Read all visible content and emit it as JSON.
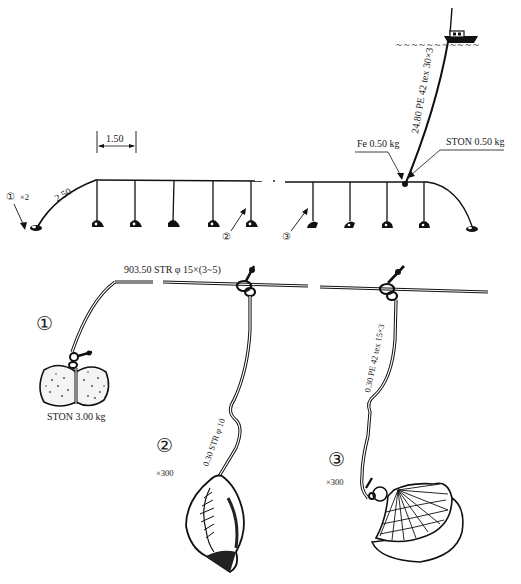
{
  "overview": {
    "buoy_line_label": "24.80 PE 42 tex 30×3",
    "fe_weight_label": "Fe 0.50 kg",
    "ston_small_label": "STON 0.50 kg",
    "spacing_label": "1.50",
    "end_line_label": "2.50",
    "callout_1": "①",
    "callout_1_count": "×2",
    "callout_2": "②",
    "callout_3": "③",
    "left_branch_count": 5,
    "right_branch_count": 4,
    "water_waves": "~ ~ ~ ~ ~ ~ ~ ~ ~ ~ ~"
  },
  "detail": {
    "main_line_label": "903.50 STR φ 15×(3~5)",
    "part1": {
      "number": "①",
      "weight_label": "STON 3.00 kg"
    },
    "part2": {
      "number": "②",
      "count": "×300",
      "branch_label": "0.30 STR φ 10"
    },
    "part3": {
      "number": "③",
      "count": "×300",
      "branch_label": "0.30 PE 42 tex 15×3"
    }
  }
}
